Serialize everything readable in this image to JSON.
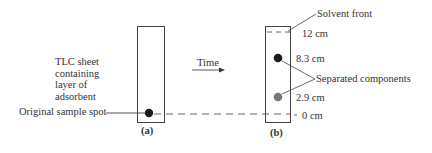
{
  "diagram": {
    "type": "TLC chromatography illustration",
    "panel_a": {
      "caption": "(a)",
      "sheet_label_lines": [
        "TLC sheet",
        "containing",
        "layer of",
        "adsorbent"
      ],
      "sample_spot_label": "Original sample spot"
    },
    "arrow": {
      "label": "Time"
    },
    "panel_b": {
      "caption": "(b)",
      "solvent_front_label": "Solvent front",
      "separated_components_label": "Separated components",
      "distances": {
        "solvent_front": "12 cm",
        "component_1": "8.3 cm",
        "component_2": "2.9 cm",
        "origin": "0 cm"
      }
    },
    "colors": {
      "line": "#444444",
      "spot_dark": "#1a1a1a",
      "spot_grey": "#777777"
    }
  }
}
